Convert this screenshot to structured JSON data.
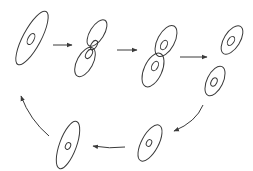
{
  "diagram": {
    "type": "cell-division-cycle",
    "colors": {
      "stroke": "#3a3a3a",
      "background": "#ffffff"
    },
    "stages": [
      {
        "id": "stage-1",
        "label": "",
        "shape": "elongated-cell-single-nucleus"
      },
      {
        "id": "stage-2",
        "label": "",
        "shape": "dumbbell-cell-two-nuclei"
      },
      {
        "id": "stage-3",
        "label": "",
        "shape": "two-daughter-cells-attached"
      },
      {
        "id": "stage-4",
        "label": "",
        "shape": "two-daughter-cells-separated"
      },
      {
        "id": "stage-5",
        "label": "",
        "shape": "small-cell"
      },
      {
        "id": "stage-6",
        "label": "",
        "shape": "growing-cell"
      }
    ],
    "arrows": [
      {
        "from": "stage-1",
        "to": "stage-2",
        "direction": "right"
      },
      {
        "from": "stage-2",
        "to": "stage-3",
        "direction": "right"
      },
      {
        "from": "stage-3",
        "to": "stage-4",
        "direction": "right"
      },
      {
        "from": "stage-4",
        "to": "stage-5",
        "direction": "down-left-curved"
      },
      {
        "from": "stage-5",
        "to": "stage-6",
        "direction": "left"
      },
      {
        "from": "stage-6",
        "to": "stage-1",
        "direction": "up-left-curved"
      }
    ]
  }
}
